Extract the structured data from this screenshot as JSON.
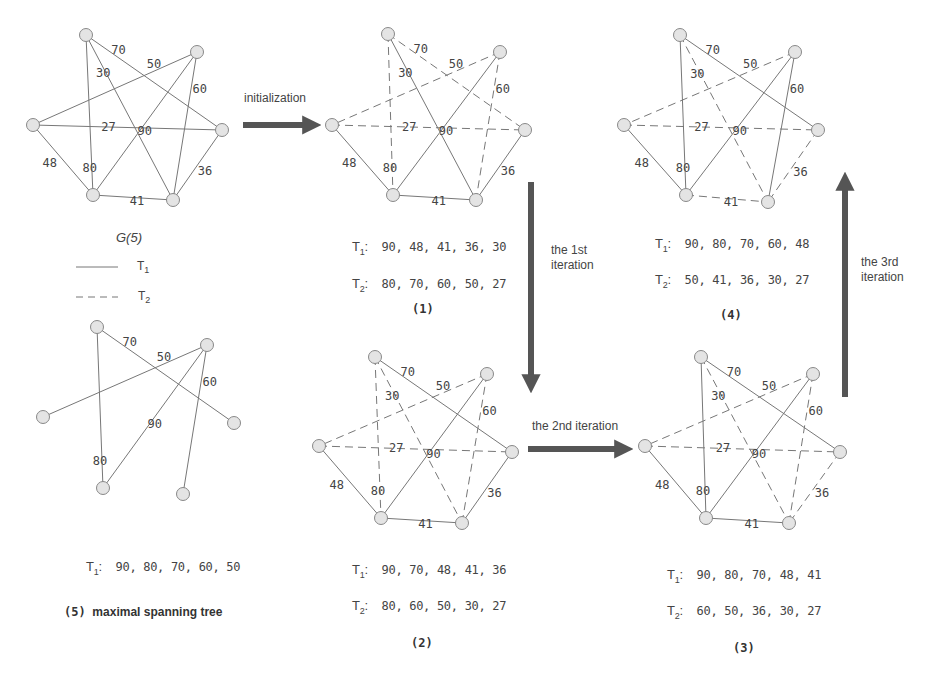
{
  "colors": {
    "edge": "#777777",
    "node_fill": "#e4e4e4",
    "node_stroke": "#888888",
    "arrow": "#555555",
    "label": "#444444"
  },
  "legend": {
    "title": "G(5)",
    "solid_label": "T",
    "solid_sub": "1",
    "dashed_label": "T",
    "dashed_sub": "2"
  },
  "arrows": [
    {
      "id": "initialization",
      "label": "initialization"
    },
    {
      "id": "iter1",
      "label_line1": "the 1st",
      "label_line2": "iteration"
    },
    {
      "id": "iter2",
      "label": "the 2nd iteration"
    },
    {
      "id": "iter3",
      "label_line1": "the 3rd",
      "label_line2": "iteration"
    }
  ],
  "graphs": {
    "g0": {
      "name": "G(5)",
      "edges": [
        {
          "u": "A",
          "v": "D",
          "w": "70",
          "style": "solid"
        },
        {
          "u": "A",
          "v": "F",
          "w": "30",
          "style": "solid"
        },
        {
          "u": "A",
          "v": "E",
          "w": "80",
          "style": "solid"
        },
        {
          "u": "B",
          "v": "C",
          "w": "50",
          "style": "solid"
        },
        {
          "u": "B",
          "v": "E",
          "w": "90",
          "style": "solid"
        },
        {
          "u": "B",
          "v": "F",
          "w": "60",
          "style": "solid"
        },
        {
          "u": "C",
          "v": "D",
          "w": "27",
          "style": "solid"
        },
        {
          "u": "C",
          "v": "E",
          "w": "48",
          "style": "solid"
        },
        {
          "u": "E",
          "v": "F",
          "w": "41",
          "style": "solid"
        },
        {
          "u": "D",
          "v": "F",
          "w": "36",
          "style": "solid"
        }
      ]
    },
    "g1": {
      "caption": "(1)",
      "t1_label": "T",
      "t1_values": "90, 48, 41, 36, 30",
      "t2_label": "T",
      "t2_values": "80, 70, 60, 50, 27",
      "t1": [
        "90",
        "48",
        "41",
        "36",
        "30"
      ],
      "t2": [
        "80",
        "70",
        "60",
        "50",
        "27"
      ]
    },
    "g2": {
      "caption": "(2)",
      "t1_label": "T",
      "t1_values": "90, 70, 48, 41, 36",
      "t2_label": "T",
      "t2_values": "80, 60, 50, 30, 27",
      "t1": [
        "90",
        "70",
        "48",
        "41",
        "36"
      ],
      "t2": [
        "80",
        "60",
        "50",
        "30",
        "27"
      ]
    },
    "g3": {
      "caption": "(3)",
      "t1_label": "T",
      "t1_values": "90, 80, 70, 48, 41",
      "t2_label": "T",
      "t2_values": "60, 50, 36, 30, 27",
      "t1": [
        "90",
        "80",
        "70",
        "48",
        "41"
      ],
      "t2": [
        "60",
        "50",
        "36",
        "30",
        "27"
      ]
    },
    "g4": {
      "caption": "(4)",
      "t1_label": "T",
      "t1_values": "90, 80, 70, 60, 48",
      "t2_label": "T",
      "t2_values": "50, 41, 36, 30, 27",
      "t1": [
        "90",
        "80",
        "70",
        "60",
        "48"
      ],
      "t2": [
        "50",
        "41",
        "36",
        "30",
        "27"
      ]
    },
    "g5": {
      "caption_num": "(5)",
      "caption_text": "maximal spanning tree",
      "t1_label": "T",
      "t1_values": "90, 80, 70, 60, 50",
      "t1": [
        "90",
        "80",
        "70",
        "60",
        "50"
      ]
    }
  },
  "edge_map": {
    "70": [
      "A",
      "D"
    ],
    "30": [
      "A",
      "F"
    ],
    "80": [
      "A",
      "E"
    ],
    "50": [
      "B",
      "C"
    ],
    "90": [
      "B",
      "E"
    ],
    "60": [
      "B",
      "F"
    ],
    "27": [
      "C",
      "D"
    ],
    "48": [
      "C",
      "E"
    ],
    "41": [
      "E",
      "F"
    ],
    "36": [
      "D",
      "F"
    ]
  }
}
